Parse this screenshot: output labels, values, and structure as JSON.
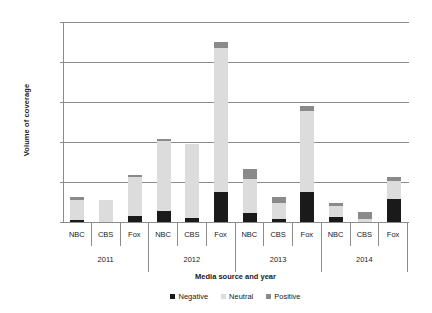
{
  "chart_data": {
    "type": "bar",
    "subtype": "stacked-vertical",
    "title": "",
    "xlabel": "Media source and year",
    "ylabel": "Volume of coverage",
    "ylim": [
      0,
      250
    ],
    "yticks": [
      0,
      50,
      100,
      150,
      200,
      250
    ],
    "grid": true,
    "legend_position": "bottom",
    "categories": [
      "NBC",
      "CBS",
      "Fox",
      "NBC",
      "CBS",
      "Fox",
      "NBC",
      "CBS",
      "Fox",
      "NBC",
      "CBS",
      "Fox"
    ],
    "groups": [
      {
        "label": "2011",
        "members": [
          "NBC",
          "CBS",
          "Fox"
        ]
      },
      {
        "label": "2012",
        "members": [
          "NBC",
          "CBS",
          "Fox"
        ]
      },
      {
        "label": "2013",
        "members": [
          "NBC",
          "CBS",
          "Fox"
        ]
      },
      {
        "label": "2014",
        "members": [
          "NBC",
          "CBS",
          "Fox"
        ]
      }
    ],
    "series": [
      {
        "name": "Negative",
        "color": "#1a1a1a",
        "values": [
          3,
          0,
          7,
          14,
          5,
          38,
          11,
          4,
          37,
          6,
          0,
          29
        ]
      },
      {
        "name": "Neutral",
        "color": "#dcdcdc",
        "values": [
          25,
          27,
          49,
          87,
          93,
          180,
          43,
          20,
          102,
          14,
          4,
          22
        ]
      },
      {
        "name": "Positive",
        "color": "#8a8a8a",
        "values": [
          3,
          0,
          3,
          3,
          0,
          7,
          12,
          7,
          6,
          4,
          8,
          5
        ]
      }
    ],
    "totals": [
      31,
      27,
      59,
      104,
      98,
      225,
      66,
      31,
      145,
      24,
      12,
      56
    ]
  },
  "legend": {
    "items": [
      {
        "label": "Negative",
        "swatch": "neg"
      },
      {
        "label": "Neutral",
        "swatch": "neu"
      },
      {
        "label": "Positive",
        "swatch": "pos"
      }
    ]
  }
}
